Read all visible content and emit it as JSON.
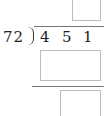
{
  "problem": {
    "divisor": "72",
    "dividend_digits": [
      "4",
      "5",
      "1"
    ],
    "quotient_box": "",
    "product_box": "",
    "remainder_box": ""
  }
}
